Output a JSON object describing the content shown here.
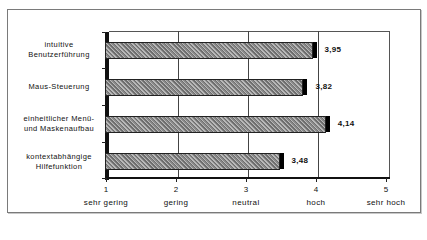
{
  "chart_data": {
    "type": "bar",
    "orientation": "horizontal",
    "title": "",
    "xlabel": "",
    "ylabel": "",
    "xlim": [
      1,
      5
    ],
    "categories": [
      "intuitive Benutzerführung",
      "Maus-Steuerung",
      "einheitlicher Menü- und Maskenaufbau",
      "kontextabhängige Hilfefunktion"
    ],
    "category_lines": [
      [
        "intuitive",
        "Benutzerführung"
      ],
      [
        "Maus-Steuerung"
      ],
      [
        "einheitlicher Menü-",
        "und Maskenaufbau"
      ],
      [
        "kontextabhängige",
        "Hilfefunktion"
      ]
    ],
    "values": [
      3.95,
      3.82,
      4.14,
      3.48
    ],
    "value_labels": [
      "3,95",
      "3,82",
      "4,14",
      "3,48"
    ],
    "x_ticks": [
      "1",
      "2",
      "3",
      "4",
      "5"
    ],
    "x_tick_labels": [
      "sehr gering",
      "gering",
      "neutral",
      "hoch",
      "sehr hoch"
    ],
    "grid": "vertical",
    "legend": "none",
    "style": "3d-hatched"
  }
}
